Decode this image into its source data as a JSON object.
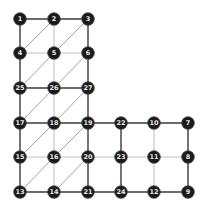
{
  "graph": {
    "nodes": [
      {
        "id": "1",
        "row": 0,
        "col": 0
      },
      {
        "id": "2",
        "row": 0,
        "col": 1
      },
      {
        "id": "3",
        "row": 0,
        "col": 2
      },
      {
        "id": "4",
        "row": 1,
        "col": 0
      },
      {
        "id": "5",
        "row": 1,
        "col": 1
      },
      {
        "id": "6",
        "row": 1,
        "col": 2
      },
      {
        "id": "25",
        "row": 2,
        "col": 0
      },
      {
        "id": "26",
        "row": 2,
        "col": 1
      },
      {
        "id": "27",
        "row": 2,
        "col": 2
      },
      {
        "id": "17",
        "row": 3,
        "col": 0
      },
      {
        "id": "18",
        "row": 3,
        "col": 1
      },
      {
        "id": "19",
        "row": 3,
        "col": 2
      },
      {
        "id": "22",
        "row": 3,
        "col": 3
      },
      {
        "id": "10",
        "row": 3,
        "col": 4
      },
      {
        "id": "7",
        "row": 3,
        "col": 5
      },
      {
        "id": "15",
        "row": 4,
        "col": 0
      },
      {
        "id": "16",
        "row": 4,
        "col": 1
      },
      {
        "id": "20",
        "row": 4,
        "col": 2
      },
      {
        "id": "23",
        "row": 4,
        "col": 3
      },
      {
        "id": "11",
        "row": 4,
        "col": 4
      },
      {
        "id": "8",
        "row": 4,
        "col": 5
      },
      {
        "id": "13",
        "row": 5,
        "col": 0
      },
      {
        "id": "14",
        "row": 5,
        "col": 1
      },
      {
        "id": "21",
        "row": 5,
        "col": 2
      },
      {
        "id": "24",
        "row": 5,
        "col": 3
      },
      {
        "id": "12",
        "row": 5,
        "col": 4
      },
      {
        "id": "9",
        "row": 5,
        "col": 5
      }
    ],
    "edges": [
      {
        "from": "1",
        "to": "2",
        "style": "dark"
      },
      {
        "from": "2",
        "to": "3",
        "style": "dark"
      },
      {
        "from": "1",
        "to": "4",
        "style": "dark"
      },
      {
        "from": "2",
        "to": "5",
        "style": "light"
      },
      {
        "from": "3",
        "to": "6",
        "style": "dark"
      },
      {
        "from": "4",
        "to": "5",
        "style": "light"
      },
      {
        "from": "5",
        "to": "6",
        "style": "light"
      },
      {
        "from": "4",
        "to": "25",
        "style": "dark"
      },
      {
        "from": "5",
        "to": "26",
        "style": "light"
      },
      {
        "from": "6",
        "to": "27",
        "style": "dark"
      },
      {
        "from": "25",
        "to": "26",
        "style": "dark"
      },
      {
        "from": "26",
        "to": "27",
        "style": "dark"
      },
      {
        "from": "25",
        "to": "17",
        "style": "dark"
      },
      {
        "from": "26",
        "to": "18",
        "style": "light"
      },
      {
        "from": "27",
        "to": "19",
        "style": "dark"
      },
      {
        "from": "17",
        "to": "18",
        "style": "dark"
      },
      {
        "from": "18",
        "to": "19",
        "style": "dark"
      },
      {
        "from": "19",
        "to": "22",
        "style": "dark"
      },
      {
        "from": "22",
        "to": "10",
        "style": "dark"
      },
      {
        "from": "10",
        "to": "7",
        "style": "dark"
      },
      {
        "from": "17",
        "to": "15",
        "style": "dark"
      },
      {
        "from": "18",
        "to": "16",
        "style": "light"
      },
      {
        "from": "19",
        "to": "20",
        "style": "dark"
      },
      {
        "from": "22",
        "to": "23",
        "style": "dark"
      },
      {
        "from": "10",
        "to": "11",
        "style": "light"
      },
      {
        "from": "7",
        "to": "8",
        "style": "dark"
      },
      {
        "from": "15",
        "to": "16",
        "style": "light"
      },
      {
        "from": "16",
        "to": "20",
        "style": "light"
      },
      {
        "from": "20",
        "to": "23",
        "style": "light"
      },
      {
        "from": "23",
        "to": "11",
        "style": "light"
      },
      {
        "from": "11",
        "to": "8",
        "style": "light"
      },
      {
        "from": "15",
        "to": "13",
        "style": "dark"
      },
      {
        "from": "16",
        "to": "14",
        "style": "light"
      },
      {
        "from": "20",
        "to": "21",
        "style": "dark"
      },
      {
        "from": "23",
        "to": "24",
        "style": "dark"
      },
      {
        "from": "11",
        "to": "12",
        "style": "light"
      },
      {
        "from": "8",
        "to": "9",
        "style": "dark"
      },
      {
        "from": "13",
        "to": "14",
        "style": "dark"
      },
      {
        "from": "14",
        "to": "21",
        "style": "dark"
      },
      {
        "from": "21",
        "to": "24",
        "style": "dark"
      },
      {
        "from": "24",
        "to": "12",
        "style": "dark"
      },
      {
        "from": "12",
        "to": "9",
        "style": "dark"
      },
      {
        "from": "4",
        "to": "2",
        "style": "diag"
      },
      {
        "from": "5",
        "to": "3",
        "style": "diag"
      },
      {
        "from": "25",
        "to": "5",
        "style": "diag"
      },
      {
        "from": "26",
        "to": "6",
        "style": "diag"
      },
      {
        "from": "17",
        "to": "26",
        "style": "diag"
      },
      {
        "from": "18",
        "to": "27",
        "style": "diag"
      },
      {
        "from": "15",
        "to": "18",
        "style": "diag"
      },
      {
        "from": "16",
        "to": "19",
        "style": "diag"
      },
      {
        "from": "13",
        "to": "16",
        "style": "diag"
      },
      {
        "from": "14",
        "to": "20",
        "style": "diag"
      }
    ]
  }
}
